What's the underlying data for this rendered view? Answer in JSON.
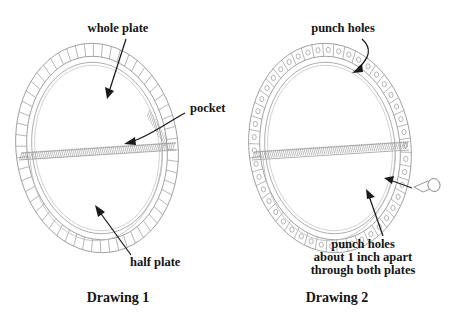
{
  "figure": {
    "background_color": "#ffffff",
    "ink_color": "#141414",
    "line_color": "#9a9a9a"
  },
  "drawing1": {
    "caption": "Drawing 1",
    "caption_x": 118,
    "caption_y": 302,
    "center_x": 97,
    "center_y": 148,
    "labels": [
      {
        "name": "whole-plate",
        "text": "whole plate",
        "x": 118,
        "y": 32,
        "anchor": "middle"
      },
      {
        "name": "pocket",
        "text": "pocket",
        "x": 190,
        "y": 112,
        "anchor": "start"
      },
      {
        "name": "half-plate",
        "text": "half plate",
        "x": 130,
        "y": 266,
        "anchor": "start"
      }
    ]
  },
  "drawing2": {
    "caption": "Drawing 2",
    "caption_x": 337,
    "caption_y": 302,
    "center_x": 330,
    "center_y": 148,
    "labels": [
      {
        "name": "punch-holes-top",
        "text": "punch holes",
        "x": 343,
        "y": 32,
        "anchor": "middle"
      }
    ],
    "note": {
      "name": "punch-holes-note",
      "lines": [
        "punch holes",
        "about 1 inch apart",
        "through both plates"
      ],
      "x": 363,
      "y": 248,
      "line_height": 13
    },
    "pin": {
      "name": "punch-pin",
      "x": 414,
      "y": 191
    }
  }
}
